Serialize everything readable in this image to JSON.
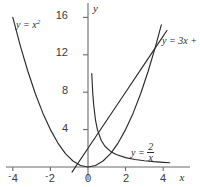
{
  "chart_data": {
    "type": "line",
    "title": "",
    "subtitle": "",
    "xlabel": "x",
    "ylabel": "y",
    "xlim": [
      -4.35,
      4.6
    ],
    "ylim": [
      -1.9,
      17.2
    ],
    "grid": false,
    "legend": "inline-curve-labels",
    "x_ticks": [
      -4,
      -2,
      0,
      2,
      4
    ],
    "x_tick_labels": [
      "-4",
      "-2",
      "0",
      "2",
      "4"
    ],
    "y_ticks": [
      4,
      8,
      12,
      16
    ],
    "y_tick_labels": [
      "4",
      "8",
      "12",
      "16"
    ],
    "series": [
      {
        "name": "y = x^2",
        "label": "y = x",
        "label_exponent": "2",
        "equation": "y = x^2",
        "x": [
          -4.0,
          -3.6,
          -3.2,
          -2.8,
          -2.4,
          -2.0,
          -1.6,
          -1.2,
          -0.8,
          -0.4,
          0.0,
          0.4,
          0.8,
          1.2,
          1.6,
          2.0,
          2.4,
          2.8,
          3.2,
          3.6,
          3.9
        ],
        "values": [
          16.0,
          12.96,
          10.24,
          7.84,
          5.76,
          4.0,
          2.56,
          1.44,
          0.64,
          0.16,
          0.0,
          0.16,
          0.64,
          1.44,
          2.56,
          4.0,
          5.76,
          7.84,
          10.24,
          12.96,
          15.21
        ]
      },
      {
        "name": "y = 3x + 2",
        "label": "y = 3x +",
        "label_truncated": true,
        "equation": "y = 3x + 2",
        "x": [
          -0.85,
          0.0,
          1.0,
          2.0,
          3.0,
          3.9,
          4.2
        ],
        "values": [
          -0.55,
          2.0,
          5.0,
          8.0,
          11.0,
          13.7,
          14.6
        ]
      },
      {
        "name": "y = 2/x",
        "label": "y =",
        "label_numerator": "2",
        "label_denominator": "x",
        "equation": "y = 2/x",
        "x": [
          0.2,
          0.25,
          0.3,
          0.4,
          0.5,
          0.7,
          0.9,
          1.2,
          1.5,
          2.0,
          2.5,
          3.0,
          3.5,
          4.0,
          4.35
        ],
        "values": [
          10.0,
          8.0,
          6.67,
          5.0,
          4.0,
          2.86,
          2.22,
          1.67,
          1.33,
          1.0,
          0.8,
          0.67,
          0.57,
          0.5,
          0.46
        ]
      }
    ],
    "annotations": [
      {
        "name": "parabola-label",
        "text": "y = x^2",
        "x": -3.3,
        "y": 15.2
      },
      {
        "name": "line-label",
        "text": "y = 3x +",
        "x": 4.3,
        "y": 13.6
      },
      {
        "name": "hyperbola-label",
        "text": "y = 2/x",
        "x": 2.6,
        "y": 1.9
      }
    ],
    "colors": {
      "curve": "#2b2b2b",
      "axis": "#6b6b6b",
      "tick_text": "#3a3a3a",
      "background": "#ffffff"
    }
  }
}
